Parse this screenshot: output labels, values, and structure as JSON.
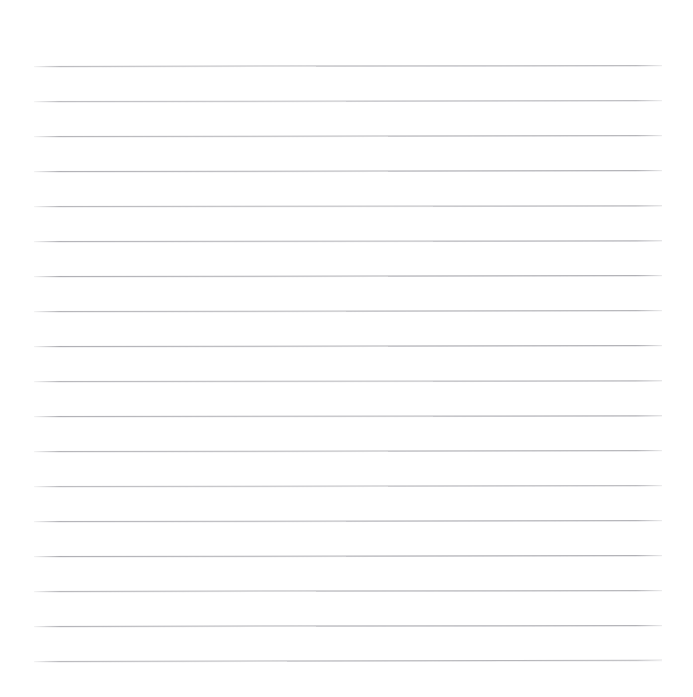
{
  "page": {
    "kind": "ruled-paper-sheet",
    "width_px": 693,
    "height_px": 697,
    "background_color": "#ffffff",
    "rule_color": "#b4b4b8",
    "rule_thickness_px": 1,
    "rule_count": 18,
    "left_margin_px": 34,
    "right_edge_px": 662,
    "rule_length_px": 628,
    "top_margin_px": 66,
    "bottom_margin_px": 36,
    "average_rule_spacing_px": 35,
    "text_content": "",
    "notes_written": "none"
  },
  "rules": [
    {
      "index": 1,
      "y_px": 66,
      "x_start_px": 34,
      "x_end_px": 662,
      "tilt_deg": -0.1,
      "color": "#b8b8bc"
    },
    {
      "index": 2,
      "y_px": 101,
      "x_start_px": 34,
      "x_end_px": 662,
      "tilt_deg": -0.09,
      "color": "#bcbcc0"
    },
    {
      "index": 3,
      "y_px": 136,
      "x_start_px": 34,
      "x_end_px": 662,
      "tilt_deg": -0.08,
      "color": "#b4b4b8"
    },
    {
      "index": 4,
      "y_px": 171,
      "x_start_px": 34,
      "x_end_px": 662,
      "tilt_deg": -0.08,
      "color": "#b0b0b5"
    },
    {
      "index": 5,
      "y_px": 206,
      "x_start_px": 34,
      "x_end_px": 662,
      "tilt_deg": -0.07,
      "color": "#b6b6ba"
    },
    {
      "index": 6,
      "y_px": 241,
      "x_start_px": 34,
      "x_end_px": 662,
      "tilt_deg": -0.07,
      "color": "#b2b2b7"
    },
    {
      "index": 7,
      "y_px": 276,
      "x_start_px": 34,
      "x_end_px": 662,
      "tilt_deg": -0.08,
      "color": "#aeaeb3"
    },
    {
      "index": 8,
      "y_px": 311,
      "x_start_px": 34,
      "x_end_px": 662,
      "tilt_deg": -0.09,
      "color": "#b4b4b8"
    },
    {
      "index": 9,
      "y_px": 346,
      "x_start_px": 34,
      "x_end_px": 662,
      "tilt_deg": -0.08,
      "color": "#aeaeb3"
    },
    {
      "index": 10,
      "y_px": 381,
      "x_start_px": 34,
      "x_end_px": 662,
      "tilt_deg": -0.07,
      "color": "#b6b6ba"
    },
    {
      "index": 11,
      "y_px": 416,
      "x_start_px": 34,
      "x_end_px": 662,
      "tilt_deg": -0.07,
      "color": "#b0b0b5"
    },
    {
      "index": 12,
      "y_px": 451,
      "x_start_px": 34,
      "x_end_px": 662,
      "tilt_deg": -0.08,
      "color": "#b4b4b8"
    },
    {
      "index": 13,
      "y_px": 486,
      "x_start_px": 34,
      "x_end_px": 662,
      "tilt_deg": -0.08,
      "color": "#bababe"
    },
    {
      "index": 14,
      "y_px": 521,
      "x_start_px": 34,
      "x_end_px": 662,
      "tilt_deg": -0.09,
      "color": "#b2b2b7"
    },
    {
      "index": 15,
      "y_px": 556,
      "x_start_px": 34,
      "x_end_px": 662,
      "tilt_deg": -0.09,
      "color": "#aeaeb3"
    },
    {
      "index": 16,
      "y_px": 591,
      "x_start_px": 34,
      "x_end_px": 662,
      "tilt_deg": -0.1,
      "color": "#b4b4b8"
    },
    {
      "index": 17,
      "y_px": 626,
      "x_start_px": 34,
      "x_end_px": 662,
      "tilt_deg": -0.1,
      "color": "#b0b0b5"
    },
    {
      "index": 18,
      "y_px": 661,
      "x_start_px": 34,
      "x_end_px": 662,
      "tilt_deg": -0.11,
      "color": "#b6b6ba"
    }
  ]
}
